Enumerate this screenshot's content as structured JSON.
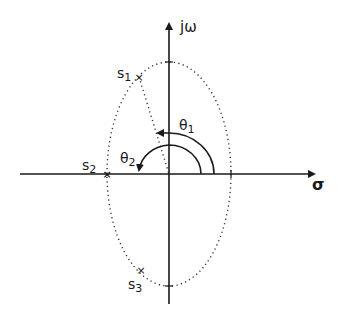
{
  "diagram": {
    "axes": {
      "vertical_label": "jω",
      "horizontal_label": "σ"
    },
    "points": [
      {
        "id": "s1",
        "label": "s",
        "subscript": "1",
        "marker": "×"
      },
      {
        "id": "s2",
        "label": "s",
        "subscript": "2",
        "marker": "×"
      },
      {
        "id": "s3",
        "label": "s",
        "subscript": "3",
        "marker": "×"
      }
    ],
    "angles": [
      {
        "id": "theta1",
        "label": "θ",
        "subscript": "1"
      },
      {
        "id": "theta2",
        "label": "θ",
        "subscript": "2"
      }
    ],
    "colors": {
      "ink": "#1a1a1a",
      "background": "#ffffff"
    }
  }
}
